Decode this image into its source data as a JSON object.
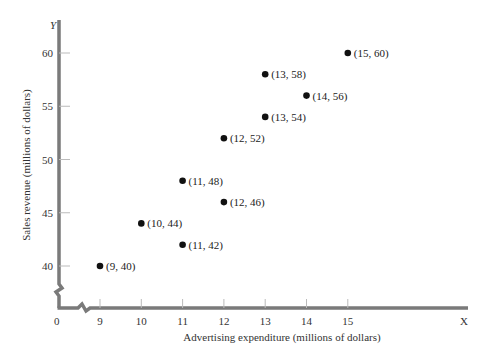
{
  "chart_data": {
    "type": "scatter",
    "title": "",
    "xlabel": "Advertising expenditure (millions of dollars)",
    "ylabel": "Sales revenue (millions of dollars)",
    "x_axis_letter": "X",
    "y_axis_letter": "Y",
    "origin_label": "0",
    "x_ticks": [
      9,
      10,
      11,
      12,
      13,
      14,
      15
    ],
    "y_ticks": [
      40,
      45,
      50,
      55,
      60
    ],
    "xlim": [
      8,
      18
    ],
    "ylim": [
      35,
      62
    ],
    "axis_breaks": true,
    "grid": false,
    "points": [
      {
        "x": 9,
        "y": 40,
        "label": "(9, 40)"
      },
      {
        "x": 10,
        "y": 44,
        "label": "(10, 44)"
      },
      {
        "x": 11,
        "y": 42,
        "label": "(11, 42)"
      },
      {
        "x": 11,
        "y": 48,
        "label": "(11, 48)"
      },
      {
        "x": 12,
        "y": 46,
        "label": "(12, 46)"
      },
      {
        "x": 12,
        "y": 52,
        "label": "(12, 52)"
      },
      {
        "x": 13,
        "y": 54,
        "label": "(13, 54)"
      },
      {
        "x": 13,
        "y": 58,
        "label": "(13, 58)"
      },
      {
        "x": 14,
        "y": 56,
        "label": "(14, 56)"
      },
      {
        "x": 15,
        "y": 60,
        "label": "(15, 60)"
      }
    ]
  },
  "style": {
    "axis_color": "#7a7a7a",
    "point_color": "#111111"
  }
}
